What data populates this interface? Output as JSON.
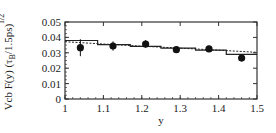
{
  "chart_data": {
    "type": "scatter",
    "title": "",
    "xlabel": "y",
    "ylabel": "Vcb F(y) (τ_B/1.5ps)^1/2",
    "xlim": [
      1,
      1.5
    ],
    "ylim": [
      0,
      0.05
    ],
    "grid": false,
    "legend": null,
    "x_ticks": [
      "1",
      "1.1",
      "1.2",
      "1.3",
      "1.4",
      "1.5"
    ],
    "y_ticks": [
      "0",
      "0.01",
      "0.02",
      "0.03",
      "0.04",
      "0.05"
    ],
    "series": [
      {
        "name": "data",
        "style": "points-with-errorbars",
        "x": [
          1.04,
          1.125,
          1.21,
          1.29,
          1.375,
          1.46
        ],
        "y": [
          0.0333,
          0.0344,
          0.0357,
          0.032,
          0.0325,
          0.0266
        ],
        "yerr": [
          0.0055,
          0.003,
          0.0025,
          0.002,
          0.002,
          0.0015
        ]
      },
      {
        "name": "binned fit",
        "style": "solid-step",
        "bin_edges": [
          1.0,
          1.085,
          1.17,
          1.25,
          1.34,
          1.42,
          1.5
        ],
        "values": [
          0.038,
          0.0353,
          0.0342,
          0.033,
          0.0318,
          0.029
        ]
      },
      {
        "name": "fit curve",
        "style": "dashed",
        "x": [
          1.0,
          1.1,
          1.2,
          1.3,
          1.4,
          1.5
        ],
        "y": [
          0.0372,
          0.0357,
          0.0343,
          0.033,
          0.0317,
          0.0303
        ]
      }
    ]
  }
}
